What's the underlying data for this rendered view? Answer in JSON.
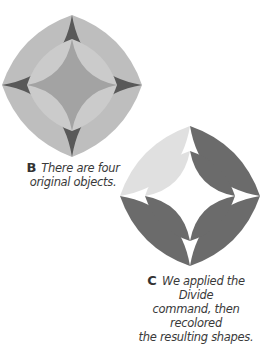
{
  "figures": [
    {
      "id": "B",
      "label": "B",
      "caption": "There are four original objects.",
      "caption_lines": [
        "There are four",
        "original objects."
      ],
      "colors": {
        "outer_diamond": "#bebebe",
        "outer_astroid": "#595959",
        "inner_diamond": "#cbcbcb",
        "inner_astroid": "#a3a3a3"
      }
    },
    {
      "id": "C",
      "label": "C",
      "caption": "We applied the Divide command, then recolored the resulting shapes.",
      "caption_lines": [
        "We applied the Divide",
        "command, then recolored",
        "the resulting shapes."
      ],
      "colors": {
        "light_lens": "#e0e0e0",
        "dark_lens": "#6b6b6b",
        "background": "#ffffff"
      }
    }
  ]
}
